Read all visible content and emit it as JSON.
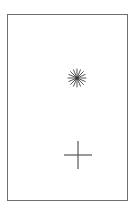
{
  "canvas": {
    "width": 133,
    "height": 212,
    "background": "#ffffff"
  },
  "frame": {
    "border_color": "#6f6f6f"
  },
  "symbols": [
    {
      "name": "asterisk",
      "icon": "asterisk-icon",
      "color": "#555555"
    },
    {
      "name": "plus",
      "icon": "plus-icon",
      "color": "#555555"
    }
  ]
}
